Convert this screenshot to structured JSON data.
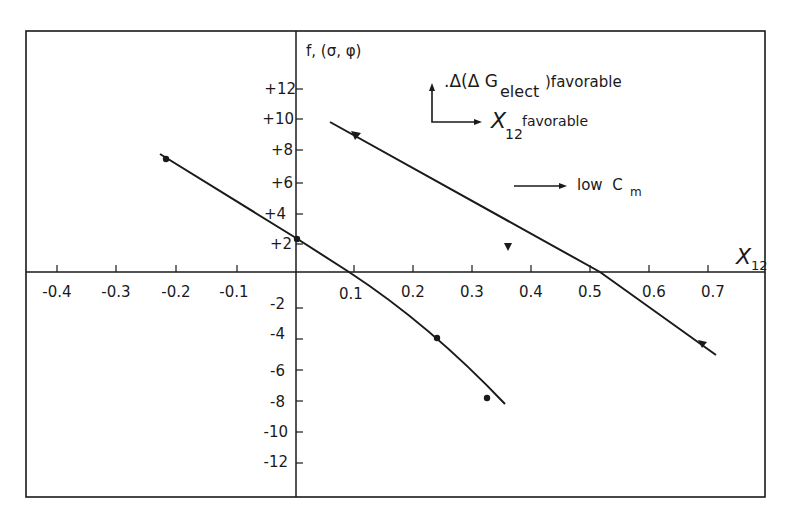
{
  "chart_data": {
    "type": "line",
    "title": "",
    "xlabel": "X12",
    "ylabel": "f, (σ, φ)",
    "xlim": [
      -0.45,
      0.8
    ],
    "ylim": [
      -14,
      15
    ],
    "grid": false,
    "x_ticks": [
      "-0.4",
      "-0.3",
      "-0.2",
      "-0.1",
      "0.1",
      "0.2",
      "0.3",
      "0.4",
      "0.5",
      "0.6",
      "0.7"
    ],
    "y_ticks": [
      "+12",
      "+10",
      "+8",
      "+6",
      "+4",
      "+2",
      "-2",
      "-4",
      "-6",
      "-8",
      "-10",
      "-12"
    ],
    "series": [
      {
        "name": "left curve",
        "line": [
          [
            -0.23,
            7.8
          ],
          [
            0.0,
            2.3
          ],
          [
            0.09,
            0.0
          ],
          [
            0.24,
            -4.3
          ],
          [
            0.35,
            -8.4
          ]
        ],
        "points": [
          {
            "x": -0.22,
            "y": 7.4,
            "marker": "dot"
          },
          {
            "x": 0.0,
            "y": 2.2,
            "marker": "dot"
          },
          {
            "x": 0.24,
            "y": -4.3,
            "marker": "dot"
          },
          {
            "x": 0.32,
            "y": -8.0,
            "marker": "dot"
          }
        ]
      },
      {
        "name": "right curve",
        "line": [
          [
            0.06,
            9.8
          ],
          [
            0.1,
            9.0
          ],
          [
            0.52,
            0.0
          ],
          [
            0.7,
            -5.4
          ]
        ],
        "points": [
          {
            "x": 0.1,
            "y": 9.0,
            "marker": "triangle-down"
          },
          {
            "x": 0.4,
            "y": 1.8,
            "marker": "triangle-down"
          },
          {
            "x": 0.68,
            "y": -4.5,
            "marker": "triangle-down"
          }
        ]
      }
    ],
    "annotations": [
      {
        "text": "Δ(Δ G",
        "sub": "elect",
        "after": ")favorable",
        "arrow": "up"
      },
      {
        "text": "X",
        "sub": "12",
        "after": "favorable",
        "arrow": "right"
      },
      {
        "text": "low  C",
        "sub": "m",
        "arrow": "right"
      }
    ]
  },
  "axis": {
    "y_label_main": "f, (σ, φ)",
    "x_label_main": "X",
    "x_label_sub": "12"
  },
  "legend": {
    "a1_pre": ".Δ(Δ G",
    "a1_sub": "elect",
    "a1_post": ")favorable",
    "a2_main": "X",
    "a2_sub": "12",
    "a2_post": "favorable",
    "a3_main": "low  C",
    "a3_sub": "m"
  },
  "ticks": {
    "x": [
      {
        "label": "-0.4",
        "px": 57
      },
      {
        "label": "-0.3",
        "px": 116
      },
      {
        "label": "-0.2",
        "px": 176
      },
      {
        "label": "-0.1",
        "px": 237
      },
      {
        "label": "0.1",
        "px": 354
      },
      {
        "label": "0.2",
        "px": 413
      },
      {
        "label": "0.3",
        "px": 472
      },
      {
        "label": "0.4",
        "px": 531
      },
      {
        "label": "0.5",
        "px": 590
      },
      {
        "label": "0.6",
        "px": 649
      },
      {
        "label": "0.7",
        "px": 708
      }
    ],
    "y": [
      {
        "label": "+12",
        "py": 89
      },
      {
        "label": "+10",
        "py": 119
      },
      {
        "label": "+8",
        "py": 150
      },
      {
        "label": "+6",
        "py": 183
      },
      {
        "label": "+4",
        "py": 214
      },
      {
        "label": "+2",
        "py": 244
      },
      {
        "label": "-2",
        "py": 308
      },
      {
        "label": "-4",
        "py": 339
      },
      {
        "label": "-6",
        "py": 370
      },
      {
        "label": "-8",
        "py": 401
      },
      {
        "label": "-10",
        "py": 432
      },
      {
        "label": "-12",
        "py": 463
      }
    ]
  }
}
